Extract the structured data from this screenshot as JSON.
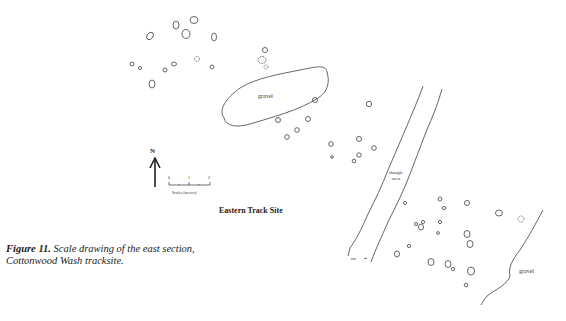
{
  "figure": {
    "caption_label": "Figure 11.",
    "caption_text": "Scale drawing of the east section, Cottonwood Wash tracksite.",
    "site_label": "Eastern Track Site"
  },
  "map": {
    "north_label": "N",
    "scale": {
      "label": "Scales (meters)",
      "ticks": [
        "0",
        "1",
        "2"
      ]
    },
    "areas": [
      {
        "label": "gravel",
        "id": "gravel-upper"
      },
      {
        "label": "shingle area",
        "id": "shingle-area"
      },
      {
        "label": "gravel",
        "id": "gravel-lower-right"
      }
    ],
    "colors": {
      "line": "#555555",
      "text": "#222222"
    }
  }
}
